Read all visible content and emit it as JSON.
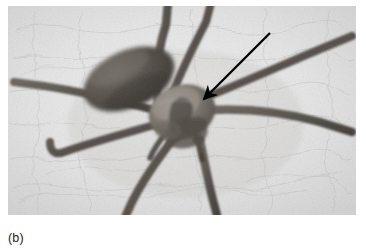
{
  "figure": {
    "caption": "(b)",
    "photo": {
      "left": 8,
      "top": 6,
      "width": 348,
      "height": 209,
      "rendering": "grayscale-photograph"
    },
    "colors": {
      "page_background": "#ffffff",
      "photo_background_light": "#ededed",
      "photo_background_mid": "#dcdcdc",
      "photo_background_shadow": "#c9c9c9",
      "spider_body_dark": "#4a4643",
      "spider_body_mid": "#6e6862",
      "spider_body_light": "#8d867f",
      "spider_leg": "#5d5750",
      "annotation_arrow": "#000000",
      "caption_text": "#1a1a1a"
    },
    "annotation": {
      "type": "arrow",
      "label": "pointer-to-cephalothorax",
      "tail_x": 262,
      "tail_y": 27,
      "tip_x": 191,
      "tip_y": 98,
      "stroke_width": 2.2,
      "head_length": 20
    },
    "anatomy": {
      "abdomen": {
        "cx": 121,
        "cy": 73,
        "rx": 47,
        "ry": 28,
        "rotation_deg": -24
      },
      "cephalothorax": {
        "cx": 174,
        "cy": 106,
        "rx": 33,
        "ry": 27,
        "rotation_deg": -18
      },
      "leg_count": 8
    }
  }
}
